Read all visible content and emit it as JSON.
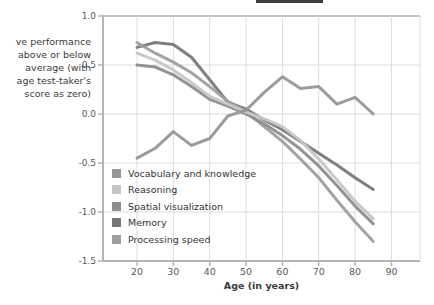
{
  "figure": {
    "y_axis_title_lines": [
      "ve performance",
      "above or below",
      "average (with",
      "age test-taker's",
      "score as zero)"
    ]
  },
  "chart_data": {
    "type": "line",
    "title": "",
    "xlabel": "Age (in years)",
    "ylabel": "ve performance above or below average (with age test-taker's score as zero)",
    "xlim": [
      10.5,
      98
    ],
    "ylim": [
      -1.5,
      1.0
    ],
    "grid": true,
    "legend_position": "inside-bottom-left",
    "x_ticks": [
      {
        "v": 20,
        "label": "20"
      },
      {
        "v": 30,
        "label": "30"
      },
      {
        "v": 40,
        "label": "40"
      },
      {
        "v": 50,
        "label": "50"
      },
      {
        "v": 60,
        "label": "60"
      },
      {
        "v": 70,
        "label": "70"
      },
      {
        "v": 80,
        "label": "80"
      },
      {
        "v": 90,
        "label": "90"
      }
    ],
    "y_ticks": [
      {
        "v": 1.0,
        "label": "1.0"
      },
      {
        "v": 0.5,
        "label": "0.5"
      },
      {
        "v": 0.0,
        "label": "0.0"
      },
      {
        "v": -0.5,
        "label": "-0.5"
      },
      {
        "v": -1.0,
        "label": "-1.0"
      },
      {
        "v": -1.5,
        "label": "-1.5"
      }
    ],
    "x": [
      20,
      25,
      30,
      35,
      40,
      45,
      50,
      55,
      60,
      65,
      70,
      75,
      80,
      85
    ],
    "series": [
      {
        "name": "Vocabulary and knowledge",
        "color": "#969696",
        "values": [
          -0.45,
          -0.35,
          -0.18,
          -0.32,
          -0.25,
          -0.02,
          0.04,
          0.22,
          0.38,
          0.26,
          0.28,
          0.1,
          0.17,
          0.0
        ]
      },
      {
        "name": "Reasoning",
        "color": "#c6c6c6",
        "values": [
          0.62,
          0.55,
          0.45,
          0.32,
          0.18,
          0.1,
          0.02,
          -0.05,
          -0.13,
          -0.27,
          -0.46,
          -0.67,
          -0.89,
          -1.07
        ]
      },
      {
        "name": "Spatial visualization",
        "color": "#8d8d8d",
        "values": [
          0.5,
          0.48,
          0.4,
          0.28,
          0.15,
          0.08,
          0.0,
          -0.1,
          -0.22,
          -0.36,
          -0.53,
          -0.73,
          -0.94,
          -1.12
        ]
      },
      {
        "name": "Memory",
        "color": "#787878",
        "values": [
          0.68,
          0.73,
          0.71,
          0.58,
          0.35,
          0.12,
          0.05,
          -0.06,
          -0.16,
          -0.28,
          -0.4,
          -0.52,
          -0.65,
          -0.77
        ]
      },
      {
        "name": "Processing speed",
        "color": "#9e9e9e",
        "values": [
          0.73,
          0.62,
          0.53,
          0.42,
          0.28,
          0.13,
          0.02,
          -0.13,
          -0.28,
          -0.46,
          -0.65,
          -0.88,
          -1.1,
          -1.3
        ]
      }
    ]
  }
}
